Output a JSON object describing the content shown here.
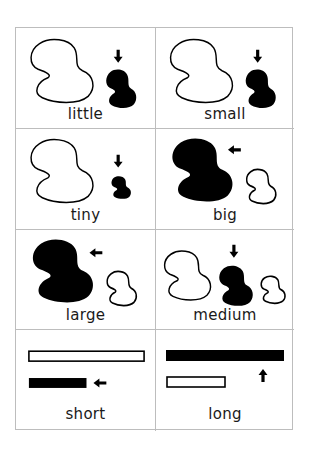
{
  "sheet": {
    "title": "",
    "colors": {
      "grid_line": "#bdbdbd",
      "ink": "#000000",
      "background": "#ffffff"
    },
    "cards": [
      {
        "id": "little",
        "label": "little",
        "highlight": "small-filled-blob",
        "arrow": "down"
      },
      {
        "id": "small",
        "label": "small",
        "highlight": "small-filled-blob",
        "arrow": "down"
      },
      {
        "id": "tiny",
        "label": "tiny",
        "highlight": "tiny-filled-blob",
        "arrow": "down"
      },
      {
        "id": "big",
        "label": "big",
        "highlight": "large-filled-blob",
        "arrow": "left"
      },
      {
        "id": "large",
        "label": "large",
        "highlight": "large-filled-blob",
        "arrow": "left"
      },
      {
        "id": "medium",
        "label": "medium",
        "highlight": "medium-filled-blob",
        "arrow": "down"
      },
      {
        "id": "short",
        "label": "short",
        "highlight": "short-filled-bar",
        "arrow": "left"
      },
      {
        "id": "long",
        "label": "long",
        "highlight": "long-filled-bar",
        "arrow": "up"
      }
    ]
  }
}
